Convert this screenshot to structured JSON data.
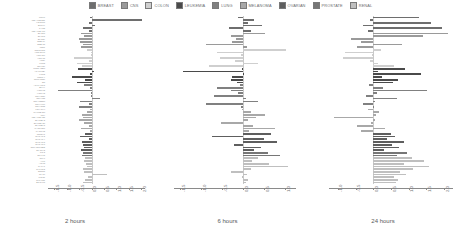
{
  "legend": {
    "items": [
      {
        "label": "BREAST",
        "color": "#6e6e6e"
      },
      {
        "label": "CNS",
        "color": "#9a9a9a"
      },
      {
        "label": "COLON",
        "color": "#cfcfcf"
      },
      {
        "label": "LEUKEMIA",
        "color": "#4a4a4a"
      },
      {
        "label": "LUNG",
        "color": "#808080"
      },
      {
        "label": "MELANOMA",
        "color": "#a8a8a8"
      },
      {
        "label": "OVARIAN",
        "color": "#5e5e5e"
      },
      {
        "label": "PROSTATE",
        "color": "#767676"
      },
      {
        "label": "RENAL",
        "color": "#bfbfbf"
      }
    ]
  },
  "chart_data": {
    "type": "bar",
    "title": "",
    "orientation": "horizontal",
    "grid": false,
    "legend_position": "top-center",
    "xlabel": "",
    "ylabel": "",
    "panels": [
      {
        "title": "2 hours",
        "xlim": [
          -1.75,
          2.15
        ],
        "xticks": [
          -1.5,
          -1.0,
          -0.5,
          0.0,
          0.5,
          1.0,
          1.5,
          2.0
        ],
        "xticklabels": [
          "-1.5",
          "-1.0",
          "-0.5",
          "0.0",
          "0.5",
          "1.0",
          "1.5",
          "2.0"
        ],
        "values": [
          -0.06,
          2.02,
          -0.1,
          0.12,
          -0.33,
          -0.11,
          -0.44,
          -0.3,
          -0.52,
          -0.46,
          -0.34,
          -0.41,
          -0.2,
          -0.04,
          -0.02,
          -0.7,
          -0.12,
          -0.58,
          -0.4,
          -0.55,
          0.1,
          -0.08,
          -0.78,
          -0.26,
          -0.6,
          -0.3,
          -0.06,
          -1.36,
          -0.04,
          -0.02,
          0.35,
          -0.45,
          -0.12,
          -0.5,
          -0.06,
          -0.18,
          -0.4,
          -0.34,
          -0.52,
          -0.3,
          -0.1,
          -0.44,
          -0.08,
          -0.28,
          -0.46,
          -0.12,
          -0.4,
          -0.36,
          -0.3,
          -0.42,
          -0.34,
          -0.38,
          -0.26,
          -0.3,
          -0.24,
          -0.2,
          -0.36,
          -0.3,
          0.62,
          -0.16,
          -0.28,
          -0.34
        ]
      },
      {
        "title": "6 hours",
        "xlim": [
          -1.65,
          1.25
        ],
        "xticks": [
          -1.5,
          -1.0,
          -0.5,
          0.0,
          0.5,
          1.0
        ],
        "xticklabels": [
          "-1.5",
          "-1.0",
          "-0.5",
          "0.0",
          "0.5",
          "1.0"
        ],
        "values": [
          -0.12,
          0.26,
          0.1,
          0.44,
          -0.34,
          0.18,
          0.52,
          -0.3,
          -0.18,
          -0.26,
          -0.88,
          0.08,
          1.02,
          -0.62,
          -0.06,
          -0.56,
          -0.2,
          0.34,
          -0.82,
          -0.04,
          -1.44,
          0.02,
          -0.26,
          -0.3,
          -0.16,
          -0.08,
          -0.62,
          -0.3,
          -0.12,
          -0.7,
          0.06,
          0.34,
          -0.9,
          -0.06,
          -0.04,
          0.18,
          0.52,
          0.3,
          0.1,
          -0.54,
          0.22,
          0.76,
          0.14,
          0.66,
          -0.74,
          0.48,
          0.8,
          -0.22,
          0.42,
          0.26,
          0.58,
          0.86,
          0.34,
          0.2,
          0.62,
          1.06,
          0.18,
          -0.3,
          0.08,
          -0.04,
          0.12,
          0.06
        ]
      },
      {
        "title": "24 hours",
        "xlim": [
          -1.25,
          2.25
        ],
        "xticks": [
          -1.0,
          -0.5,
          0.0,
          0.5,
          1.0,
          1.5,
          2.0
        ],
        "xticklabels": [
          "-1.0",
          "-0.5",
          "0.0",
          "0.5",
          "1.0",
          "1.5",
          "2.0"
        ],
        "values": [
          1.3,
          -0.08,
          1.62,
          -0.3,
          1.94,
          -0.16,
          2.1,
          1.4,
          -0.62,
          -0.34,
          0.8,
          -0.46,
          0.22,
          -0.8,
          -0.04,
          -0.86,
          -0.1,
          0.12,
          0.58,
          0.9,
          0.14,
          1.34,
          0.24,
          0.7,
          0.56,
          -0.12,
          0.28,
          1.52,
          0.1,
          -0.2,
          0.66,
          0.06,
          -0.28,
          0.02,
          -0.14,
          0.16,
          0.08,
          -1.1,
          0.04,
          -0.06,
          -0.46,
          0.34,
          -0.34,
          0.5,
          0.62,
          0.4,
          0.86,
          0.52,
          0.74,
          0.3,
          0.96,
          0.68,
          1.08,
          1.44,
          0.88,
          1.56,
          1.12,
          0.76,
          0.92,
          0.58,
          0.7,
          0.64
        ]
      }
    ],
    "series_groups": [
      {
        "name": "BREAST",
        "count": 6,
        "color": "#6e6e6e"
      },
      {
        "name": "CNS",
        "count": 6,
        "color": "#9a9a9a"
      },
      {
        "name": "COLON",
        "count": 7,
        "color": "#cfcfcf"
      },
      {
        "name": "LEUKEMIA",
        "count": 6,
        "color": "#4a4a4a"
      },
      {
        "name": "LUNG",
        "count": 9,
        "color": "#808080"
      },
      {
        "name": "MELANOMA",
        "count": 9,
        "color": "#a8a8a8"
      },
      {
        "name": "OVARIAN",
        "count": 7,
        "color": "#5e5e5e"
      },
      {
        "name": "PROSTATE",
        "count": 2,
        "color": "#767676"
      },
      {
        "name": "RENAL",
        "count": 10,
        "color": "#bfbfbf"
      }
    ],
    "cell_lines": [
      "MCF7",
      "MDA-MB-231",
      "HS 578T",
      "BT-549",
      "T-47D",
      "MDA-MB-468",
      "SF-268",
      "SF-295",
      "SF-539",
      "SNB-19",
      "SNB-75",
      "U251",
      "COLO 205",
      "HCC-2998",
      "HCT-116",
      "HCT-15",
      "HT29",
      "KM12",
      "SW-620",
      "CCRF-CEM",
      "HL-60(TB)",
      "K-562",
      "MOLT-4",
      "RPMI-8226",
      "SR",
      "A549/ATCC",
      "EKVX",
      "HOP-62",
      "HOP-92",
      "NCI-H226",
      "NCI-H23",
      "NCI-H322M",
      "NCI-H460",
      "NCI-H522",
      "LOX IMVI",
      "MALME-3M",
      "M14",
      "MDA-MB-435",
      "SK-MEL-2",
      "SK-MEL-28",
      "SK-MEL-5",
      "UACC-257",
      "UACC-62",
      "IGROV1",
      "OVCAR-3",
      "OVCAR-4",
      "OVCAR-5",
      "OVCAR-8",
      "NCI/ADR-RES",
      "SK-OV-3",
      "PC-3",
      "DU-145",
      "786-0",
      "A498",
      "ACHN",
      "CAKI-1",
      "RXF 393",
      "SN12C",
      "TK-10",
      "UO-31",
      "RXF-631",
      "BT-549R"
    ]
  }
}
